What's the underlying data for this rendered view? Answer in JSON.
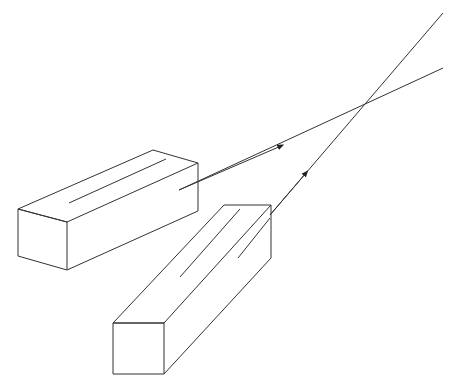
{
  "diagram": {
    "colors": {
      "stroke": "#333333",
      "background": "#ffffff"
    },
    "sources": [
      {
        "name": "source-box-1",
        "arrow_direction": "up-right"
      },
      {
        "name": "source-box-2",
        "arrow_direction": "up-right"
      }
    ]
  }
}
